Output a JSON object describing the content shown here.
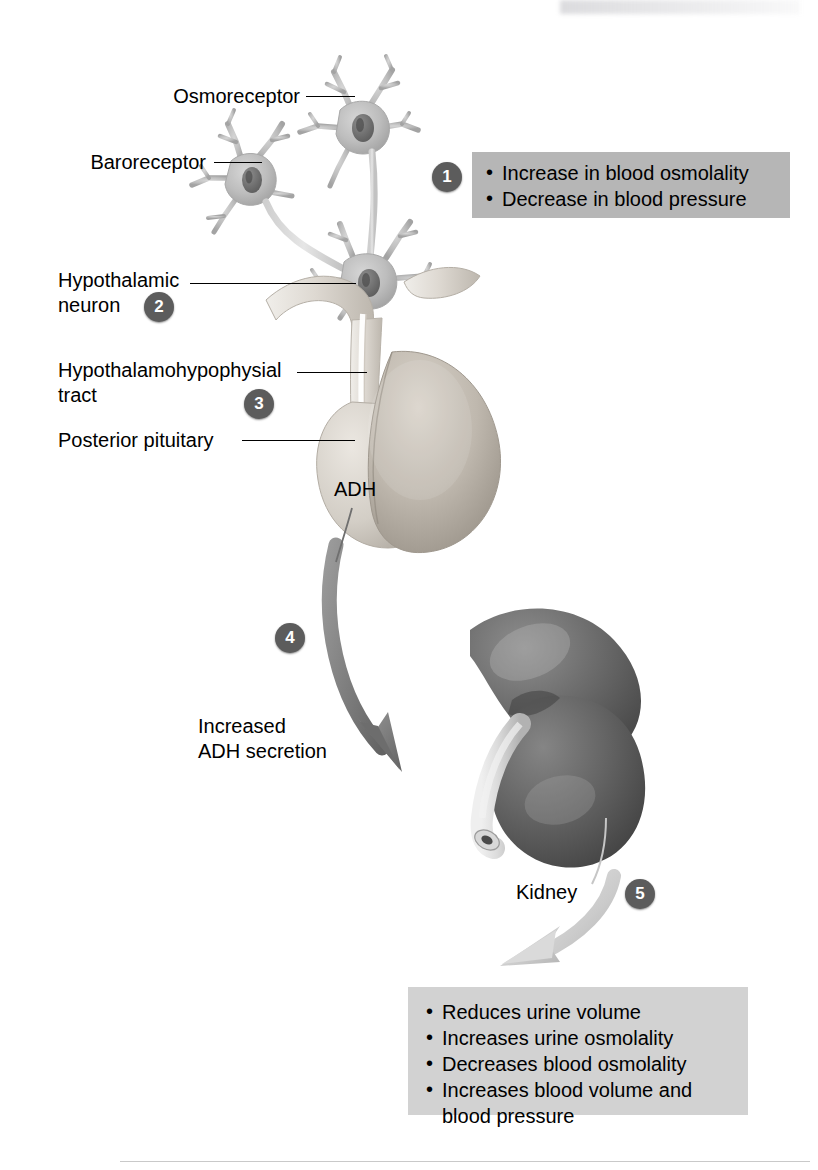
{
  "figure": {
    "background_color": "#ffffff"
  },
  "colors": {
    "badge_fill": "#5c5c5c",
    "badge_text": "#ffffff",
    "callout_stimuli_fill": "#b6b6b6",
    "callout_effects_fill": "#d2d2d2",
    "neuron_fill": "#b9b9b9",
    "pituitary_fill": "#c9c4bd",
    "kidney_fill": "#6f6f6f",
    "arrow_dark": "#7a7a7a",
    "arrow_light": "#cfcfcf",
    "leader_line": "#000000",
    "text": "#000000"
  },
  "labels": {
    "osmoreceptor": "Osmoreceptor",
    "baroreceptor": "Baroreceptor",
    "hypothalamic_neuron": "Hypothalamic\nneuron",
    "hypothalamohypophysial_tract": "Hypothalamohypophysial\ntract",
    "posterior_pituitary": "Posterior pituitary",
    "adh": "ADH",
    "increased_adh_secretion": "Increased\nADH secretion",
    "kidney": "Kidney"
  },
  "steps": [
    {
      "number": "1"
    },
    {
      "number": "2"
    },
    {
      "number": "3"
    },
    {
      "number": "4"
    },
    {
      "number": "5"
    }
  ],
  "callouts": {
    "stimuli": {
      "items": [
        "Increase in blood osmolality",
        "Decrease in blood pressure"
      ]
    },
    "effects": {
      "items": [
        "Reduces urine volume",
        "Increases urine osmolality",
        "Decreases blood osmolality",
        "Increases blood volume and\nblood pressure"
      ]
    }
  },
  "anatomy": {
    "osmoreceptor_cell": "osmoreceptor-neuron",
    "baroreceptor_cell": "baroreceptor-neuron",
    "hypothalamic_cell": "hypothalamic-neuron",
    "pituitary": "posterior-pituitary-gland",
    "kidney": "kidney-organ",
    "ureter": "ureter"
  }
}
